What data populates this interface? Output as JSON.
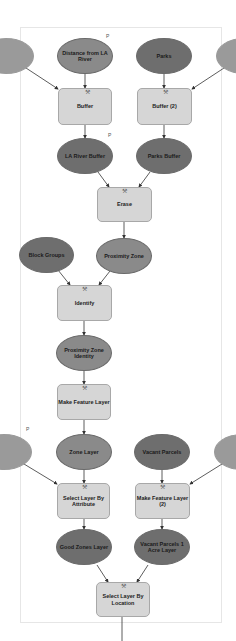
{
  "diagram": {
    "type": "ModelBuilder workflow",
    "colors": {
      "input_fill": "#6e6e6e",
      "derived_fill": "#8a8a8a",
      "tool_fill": "#d6d6d6",
      "connector": "#333333",
      "background": "#ffffff"
    },
    "parameter_marker": "P",
    "nodes": {
      "distance_la_river": "Distance from LA River",
      "parks": "Parks",
      "buffer": "Buffer",
      "buffer2": "Buffer (2)",
      "la_river_buffer": "LA River Buffer",
      "parks_buffer": "Parks Buffer",
      "erase": "Erase",
      "block_groups": "Block Groups",
      "proximity_zone": "Proximity Zone",
      "identify": "Identify",
      "proximity_zone_identity": "Proximity Zone Identity",
      "make_feature_layer": "Make Feature Layer",
      "zone_layer": "Zone Layer",
      "vacant_parcels": "Vacant Parcels",
      "select_by_attribute": "Select Layer By Attribute",
      "make_feature_layer2": "Make Feature Layer (2)",
      "good_zones_layer": "Good Zones Layer",
      "vacant_parcels_1acre": "Vacant Parcels 1 Acre Layer",
      "select_by_location": "Select Layer By Location"
    },
    "edges": [
      [
        "partial-left-top",
        "Buffer"
      ],
      [
        "Distance from LA River",
        "Buffer"
      ],
      [
        "Parks",
        "Buffer (2)"
      ],
      [
        "partial-right-top",
        "Buffer (2)"
      ],
      [
        "Buffer",
        "LA River Buffer"
      ],
      [
        "Buffer (2)",
        "Parks Buffer"
      ],
      [
        "LA River Buffer",
        "Erase"
      ],
      [
        "Parks Buffer",
        "Erase"
      ],
      [
        "Erase",
        "Proximity Zone"
      ],
      [
        "Block Groups",
        "Identify"
      ],
      [
        "Proximity Zone",
        "Identify"
      ],
      [
        "Identify",
        "Proximity Zone Identity"
      ],
      [
        "Proximity Zone Identity",
        "Make Feature Layer"
      ],
      [
        "Make Feature Layer",
        "Zone Layer"
      ],
      [
        "partial-left-bottom",
        "Select Layer By Attribute"
      ],
      [
        "Zone Layer",
        "Select Layer By Attribute"
      ],
      [
        "Vacant Parcels",
        "Make Feature Layer (2)"
      ],
      [
        "partial-right-bottom",
        "Make Feature Layer (2)"
      ],
      [
        "Select Layer By Attribute",
        "Good Zones Layer"
      ],
      [
        "Make Feature Layer (2)",
        "Vacant Parcels 1 Acre Layer"
      ],
      [
        "Good Zones Layer",
        "Select Layer By Location"
      ],
      [
        "Vacant Parcels 1 Acre Layer",
        "Select Layer By Location"
      ]
    ]
  }
}
